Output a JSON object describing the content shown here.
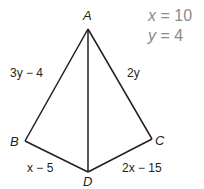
{
  "diagram": {
    "type": "kite",
    "vertices": {
      "A": {
        "label": "A",
        "x": 88,
        "y": 29
      },
      "B": {
        "label": "B",
        "x": 25,
        "y": 141
      },
      "C": {
        "label": "C",
        "x": 152,
        "y": 139
      },
      "D": {
        "label": "D",
        "x": 88,
        "y": 172
      }
    },
    "segments": [
      {
        "from": "A",
        "to": "B",
        "label": "3y − 4"
      },
      {
        "from": "A",
        "to": "C",
        "label": "2y"
      },
      {
        "from": "B",
        "to": "D",
        "label": "x − 5"
      },
      {
        "from": "C",
        "to": "D",
        "label": "2x − 15"
      },
      {
        "from": "A",
        "to": "D",
        "label": ""
      }
    ],
    "given": [
      {
        "var": "x",
        "op": " = ",
        "value": "10"
      },
      {
        "var": "y",
        "op": " = ",
        "value": "4"
      }
    ],
    "colors": {
      "line": "#231f20",
      "given_text": "#8a8a8a"
    }
  }
}
